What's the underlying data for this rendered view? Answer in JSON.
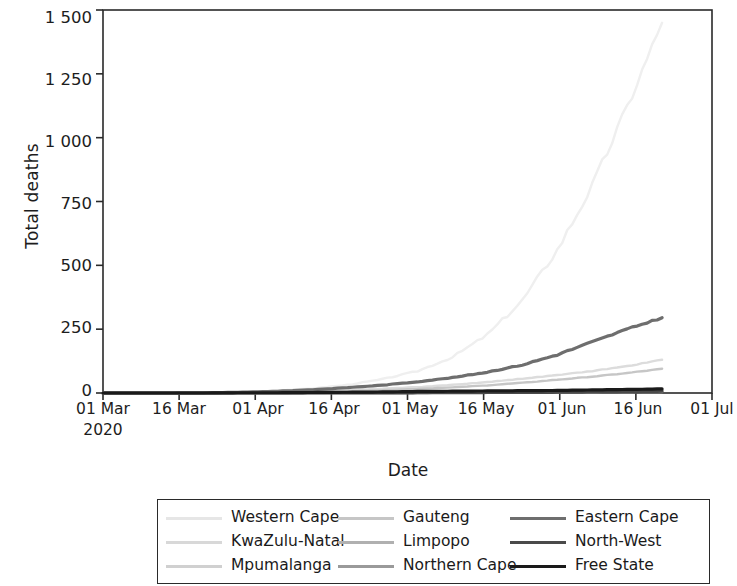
{
  "chart_data": {
    "type": "line",
    "title": "",
    "xlabel": "Date",
    "ylabel": "Total deaths",
    "grid": false,
    "legend_position": "bottom",
    "yticks": [
      "0",
      "250",
      "500",
      "750",
      "1 000",
      "1 250",
      "1 500"
    ],
    "ylim": [
      0,
      1500
    ],
    "xticks": [
      "01 Mar",
      "16 Mar",
      "01 Apr",
      "16 Apr",
      "01 May",
      "16 May",
      "01 Jun",
      "16 Jun",
      "01 Jul"
    ],
    "x_subtick": "2020",
    "xlim": [
      "2020-03-01",
      "2020-07-01"
    ],
    "x": [
      "01 Mar",
      "08 Mar",
      "15 Mar",
      "22 Mar",
      "29 Mar",
      "05 Apr",
      "12 Apr",
      "19 Apr",
      "26 Apr",
      "03 May",
      "10 May",
      "17 May",
      "24 May",
      "31 May",
      "07 Jun",
      "14 Jun",
      "21 Jun"
    ],
    "series": [
      {
        "name": "Western Cape",
        "color": "#efefef",
        "values": [
          0,
          0,
          0,
          1,
          4,
          9,
          18,
          32,
          54,
          86,
          140,
          228,
          362,
          560,
          810,
          1120,
          1450
        ]
      },
      {
        "name": "KwaZulu-Natal",
        "color": "#dcdcdc",
        "values": [
          0,
          0,
          0,
          0,
          1,
          3,
          6,
          11,
          17,
          23,
          32,
          43,
          56,
          70,
          86,
          105,
          130
        ]
      },
      {
        "name": "Mpumalanga",
        "color": "#d2d2d2",
        "values": [
          0,
          0,
          0,
          0,
          0,
          0,
          0,
          1,
          1,
          2,
          2,
          3,
          4,
          5,
          6,
          7,
          9
        ]
      },
      {
        "name": "Gauteng",
        "color": "#c6c6c6",
        "values": [
          0,
          0,
          0,
          0,
          1,
          2,
          4,
          7,
          11,
          16,
          22,
          30,
          40,
          52,
          64,
          78,
          95
        ]
      },
      {
        "name": "Limpopo",
        "color": "#b0b0b0",
        "values": [
          0,
          0,
          0,
          0,
          0,
          0,
          1,
          1,
          2,
          2,
          3,
          4,
          5,
          6,
          8,
          10,
          12
        ]
      },
      {
        "name": "Northern Cape",
        "color": "#9a9a9a",
        "values": [
          0,
          0,
          0,
          0,
          0,
          0,
          0,
          0,
          0,
          0,
          1,
          1,
          1,
          2,
          2,
          3,
          4
        ]
      },
      {
        "name": "Eastern Cape",
        "color": "#6e6e6e",
        "values": [
          0,
          0,
          0,
          1,
          3,
          7,
          13,
          21,
          31,
          44,
          60,
          82,
          110,
          150,
          200,
          250,
          295
        ]
      },
      {
        "name": "North-West",
        "color": "#4a4a4a",
        "values": [
          0,
          0,
          0,
          0,
          0,
          0,
          0,
          0,
          0,
          1,
          1,
          2,
          2,
          3,
          4,
          5,
          7
        ]
      },
      {
        "name": "Free State",
        "color": "#1a1a1a",
        "values": [
          0,
          0,
          0,
          0,
          1,
          1,
          2,
          3,
          4,
          6,
          7,
          8,
          9,
          10,
          12,
          14,
          16
        ]
      }
    ]
  },
  "legend": {
    "entries": [
      {
        "label": "Western Cape",
        "color": "#e6e6e6"
      },
      {
        "label": "Gauteng",
        "color": "#c6c6c6"
      },
      {
        "label": "Eastern Cape",
        "color": "#6e6e6e"
      },
      {
        "label": "KwaZulu-Natal",
        "color": "#d8d8d8"
      },
      {
        "label": "Limpopo",
        "color": "#b0b0b0"
      },
      {
        "label": "North-West",
        "color": "#4a4a4a"
      },
      {
        "label": "Mpumalanga",
        "color": "#d0d0d0"
      },
      {
        "label": "Northern Cape",
        "color": "#9a9a9a"
      },
      {
        "label": "Free State",
        "color": "#1a1a1a"
      }
    ]
  },
  "axes": {
    "frame_color": "#2a2a2a",
    "text_color": "#1a1a1a"
  }
}
